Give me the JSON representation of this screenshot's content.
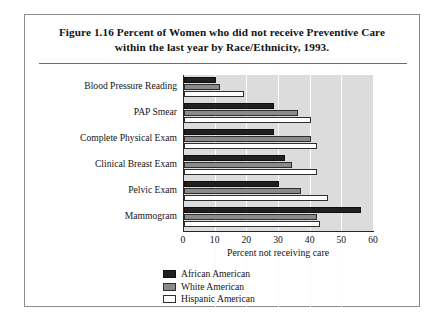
{
  "figure": {
    "title_line_1": "Figure 1.16  Percent of Women who did not receive Preventive Care",
    "title_line_2": "within the last year by Race/Ethnicity, 1993."
  },
  "chart_data": {
    "type": "bar",
    "orientation": "horizontal",
    "title": "Figure 1.16  Percent of Women who did not receive Preventive Care within the last year by Race/Ethnicity, 1993.",
    "xlabel": "Percent not receiving care",
    "ylabel": "",
    "xlim": [
      0,
      60
    ],
    "xticks": [
      0,
      10,
      20,
      30,
      40,
      50,
      60
    ],
    "grid": true,
    "grid_axis": "x",
    "legend_position": "bottom-center",
    "categories": [
      "Blood Pressure Reading",
      "PAP Smear",
      "Complete Physical Exam",
      "Clinical Breast Exam",
      "Pelvic Exam",
      "Mammogram"
    ],
    "series": [
      {
        "name": "African American",
        "color": "#231f1c",
        "values": [
          10,
          28.5,
          28.5,
          32,
          30,
          56
        ]
      },
      {
        "name": "White American",
        "color": "#8a8a8a",
        "values": [
          11.5,
          36,
          40,
          34,
          37,
          42
        ]
      },
      {
        "name": "Hispanic American",
        "color": "#ffffff",
        "values": [
          19,
          40,
          42,
          42,
          45.5,
          43
        ]
      }
    ]
  },
  "legend": [
    {
      "label": "African American",
      "swatch": "african"
    },
    {
      "label": "White American",
      "swatch": "white"
    },
    {
      "label": "Hispanic American",
      "swatch": "hispanic"
    }
  ]
}
